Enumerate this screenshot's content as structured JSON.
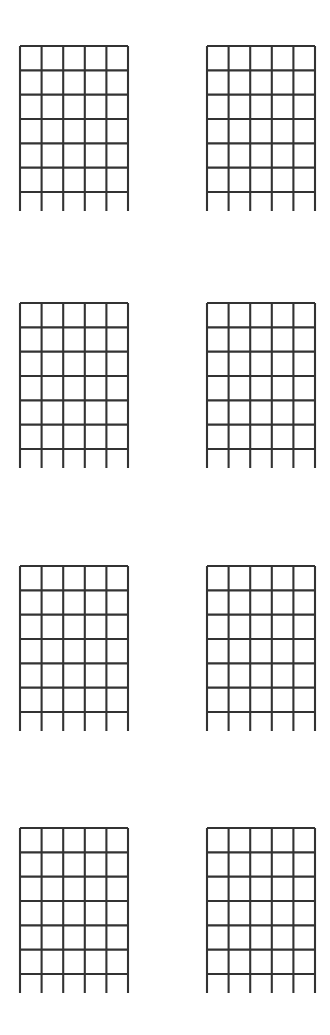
{
  "page": {
    "background_color": "#ffffff",
    "line_color": "#333333",
    "width": 330,
    "height": 1035
  },
  "sheet": {
    "kind": "blank-chord-diagram-grid",
    "rows": 4,
    "columns": 2,
    "total_diagrams": 8,
    "row_tops": [
      46,
      303,
      566,
      828
    ],
    "column_lefts": [
      20,
      207
    ],
    "diagram": {
      "strings": 6,
      "frets": 6,
      "fret_lines": 7,
      "width": 108,
      "height": 146,
      "string_overhang": 19,
      "string_spacing": 21.6,
      "fret_spacing": 24.3,
      "has_nut": false,
      "labels": []
    },
    "diagrams": [
      {
        "id": "chord-1",
        "row": 0,
        "column": 0,
        "label": ""
      },
      {
        "id": "chord-2",
        "row": 0,
        "column": 1,
        "label": ""
      },
      {
        "id": "chord-3",
        "row": 1,
        "column": 0,
        "label": ""
      },
      {
        "id": "chord-4",
        "row": 1,
        "column": 1,
        "label": ""
      },
      {
        "id": "chord-5",
        "row": 2,
        "column": 0,
        "label": ""
      },
      {
        "id": "chord-6",
        "row": 2,
        "column": 1,
        "label": ""
      },
      {
        "id": "chord-7",
        "row": 3,
        "column": 0,
        "label": ""
      },
      {
        "id": "chord-8",
        "row": 3,
        "column": 1,
        "label": ""
      }
    ]
  }
}
